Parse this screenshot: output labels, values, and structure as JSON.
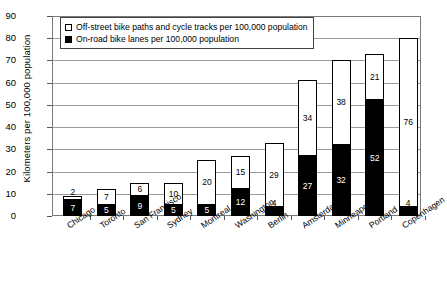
{
  "chart_data": {
    "type": "bar",
    "subtype": "stacked-vertical",
    "title": "",
    "xlabel": "",
    "ylabel": "Kilometers per 100,000 population",
    "ylim": [
      0,
      90
    ],
    "ytick_step": 10,
    "yticks": [
      0,
      10,
      20,
      30,
      40,
      50,
      60,
      70,
      80,
      90
    ],
    "grid": true,
    "grid_axis": "y",
    "legend_position": "top-left",
    "categories": [
      "Chicago",
      "Toronto",
      "San Francisco",
      "Sydney",
      "Montreal",
      "Washington",
      "Berlin",
      "Amsterdam",
      "Minneapolis",
      "Portland",
      "Copenhagen"
    ],
    "series": [
      {
        "name": "On-road bike lanes per 100,000 population",
        "color": "#000000",
        "stack_order": "bottom",
        "values": [
          7,
          5,
          9,
          5,
          5,
          12,
          4,
          27,
          32,
          52,
          4
        ]
      },
      {
        "name": "Off-street bike paths and cycle tracks per 100,000 population",
        "color": "#ffffff",
        "stack_order": "top",
        "values": [
          2,
          7,
          6,
          10,
          20,
          15,
          29,
          34,
          38,
          21,
          76
        ]
      }
    ],
    "totals": [
      9,
      12,
      15,
      15,
      25,
      27,
      33,
      61,
      70,
      73,
      80
    ]
  },
  "legend": {
    "entries": [
      {
        "swatch": "white",
        "label": "Off-street bike paths and cycle tracks per 100,000 population"
      },
      {
        "swatch": "black",
        "label": "On-road bike lanes per 100,000 population"
      }
    ]
  }
}
